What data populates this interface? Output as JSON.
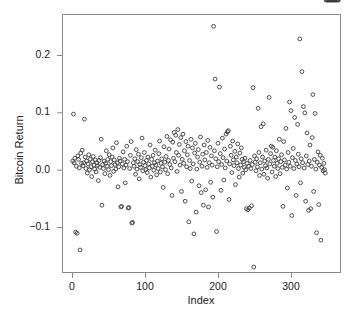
{
  "figure": {
    "background": "#ffffff",
    "plot_box": {
      "left": 62,
      "top": 14,
      "right": 340,
      "bottom": 272
    },
    "frame_color": "#8a8a8a",
    "marker_color": "#3c3c3c",
    "marker_radius": 1.9,
    "marker_shape": "open-circle"
  },
  "axes": {
    "x_title": "Index",
    "y_title": "Bitcoin Return",
    "x_ticks": [
      {
        "value": 0,
        "label": "0",
        "px": 72
      },
      {
        "value": 100,
        "label": "100",
        "px": 145
      },
      {
        "value": 200,
        "label": "200",
        "px": 218
      },
      {
        "value": 300,
        "label": "300",
        "px": 291
      }
    ],
    "y_ticks": [
      {
        "value": 0.2,
        "label": "0.2",
        "px": 55
      },
      {
        "value": 0.1,
        "label": "0.1",
        "px": 112.3
      },
      {
        "value": 0.0,
        "label": "0.0",
        "px": 169.7
      },
      {
        "value": -0.1,
        "label": "-0.1",
        "px": 227
      }
    ]
  },
  "chart_data": {
    "type": "scatter",
    "title": "",
    "xlabel": "Index",
    "ylabel": "Bitcoin Return",
    "xlim": [
      -8,
      375
    ],
    "ylim": [
      -0.178,
      0.262
    ],
    "grid": false,
    "legend": null,
    "n_points": 365,
    "marker": "open circle",
    "x": [
      1,
      2,
      3,
      4,
      5,
      6,
      7,
      8,
      9,
      10,
      11,
      12,
      13,
      14,
      15,
      16,
      17,
      18,
      19,
      20,
      21,
      22,
      23,
      24,
      25,
      26,
      27,
      28,
      29,
      30,
      31,
      32,
      33,
      34,
      35,
      36,
      37,
      38,
      39,
      40,
      41,
      42,
      43,
      44,
      45,
      46,
      47,
      48,
      49,
      50,
      51,
      52,
      53,
      54,
      55,
      56,
      57,
      58,
      59,
      60,
      61,
      62,
      63,
      64,
      65,
      66,
      67,
      68,
      69,
      70,
      71,
      72,
      73,
      74,
      75,
      76,
      77,
      78,
      79,
      80,
      81,
      82,
      83,
      84,
      85,
      86,
      87,
      88,
      89,
      90,
      91,
      92,
      93,
      94,
      95,
      96,
      97,
      98,
      99,
      100,
      101,
      102,
      103,
      104,
      105,
      106,
      107,
      108,
      109,
      110,
      111,
      112,
      113,
      114,
      115,
      116,
      117,
      118,
      119,
      120,
      121,
      122,
      123,
      124,
      125,
      126,
      127,
      128,
      129,
      130,
      131,
      132,
      133,
      134,
      135,
      136,
      137,
      138,
      139,
      140,
      141,
      142,
      143,
      144,
      145,
      146,
      147,
      148,
      149,
      150,
      151,
      152,
      153,
      154,
      155,
      156,
      157,
      158,
      159,
      160,
      161,
      162,
      163,
      164,
      165,
      166,
      167,
      168,
      169,
      170,
      171,
      172,
      173,
      174,
      175,
      176,
      177,
      178,
      179,
      180,
      181,
      182,
      183,
      184,
      185,
      186,
      187,
      188,
      189,
      190,
      191,
      192,
      193,
      194,
      195,
      196,
      197,
      198,
      199,
      200,
      201,
      202,
      203,
      204,
      205,
      206,
      207,
      208,
      209,
      210,
      211,
      212,
      213,
      214,
      215,
      216,
      217,
      218,
      219,
      220,
      221,
      222,
      223,
      224,
      225,
      226,
      227,
      228,
      229,
      230,
      231,
      232,
      233,
      234,
      235,
      236,
      237,
      238,
      239,
      240,
      241,
      242,
      243,
      244,
      245,
      246,
      247,
      248,
      249,
      250,
      251,
      252,
      253,
      254,
      255,
      256,
      257,
      258,
      259,
      260,
      261,
      262,
      263,
      264,
      265,
      266,
      267,
      268,
      269,
      270,
      271,
      272,
      273,
      274,
      275,
      276,
      277,
      278,
      279,
      280,
      281,
      282,
      283,
      284,
      285,
      286,
      287,
      288,
      289,
      290,
      291,
      292,
      293,
      294,
      295,
      296,
      297,
      298,
      299,
      300,
      301,
      302,
      303,
      304,
      305,
      306,
      307,
      308,
      309,
      310,
      311,
      312,
      313,
      314,
      315,
      316,
      317,
      318,
      319,
      320,
      321,
      322,
      323,
      324,
      325,
      326,
      327,
      328,
      329,
      330,
      331,
      332,
      333,
      334,
      335,
      336,
      337,
      338,
      339,
      340,
      341,
      342,
      343,
      344,
      345,
      346,
      347,
      348,
      349,
      350,
      351,
      352,
      353,
      354,
      355,
      356,
      357,
      358,
      359,
      360,
      361,
      362,
      363,
      364,
      365
    ],
    "y": [
      0.015,
      0.097,
      0.012,
      0.02,
      -0.109,
      0.006,
      -0.111,
      0.024,
      0.018,
      0.003,
      -0.14,
      0.029,
      0.011,
      0.034,
      0.007,
      0.012,
      0.088,
      0.022,
      0.002,
      0.015,
      -0.006,
      0.01,
      0.026,
      0.0,
      0.018,
      0.005,
      -0.012,
      0.014,
      0.023,
      0.008,
      0.001,
      0.017,
      -0.004,
      0.012,
      0.007,
      -0.019,
      0.016,
      0.004,
      0.021,
      0.053,
      -0.062,
      0.009,
      0.002,
      0.015,
      -0.007,
      0.011,
      0.033,
      0.006,
      0.018,
      0.0,
      0.026,
      -0.01,
      0.014,
      0.007,
      0.022,
      0.038,
      -0.003,
      0.017,
      0.009,
      0.001,
      0.047,
      0.012,
      -0.03,
      0.005,
      0.02,
      0.015,
      -0.065,
      -0.064,
      0.01,
      0.031,
      0.003,
      0.018,
      -0.023,
      0.008,
      0.041,
      0.014,
      -0.067,
      -0.066,
      0.002,
      0.025,
      0.049,
      -0.093,
      -0.092,
      0.012,
      0.006,
      0.019,
      -0.008,
      0.035,
      0.001,
      0.014,
      0.027,
      -0.016,
      0.009,
      0.004,
      0.021,
      0.055,
      -0.002,
      0.013,
      0.03,
      0.007,
      0.0,
      0.016,
      -0.005,
      0.022,
      0.01,
      0.003,
      0.043,
      -0.013,
      0.018,
      0.006,
      0.025,
      -0.001,
      0.012,
      0.034,
      0.008,
      -0.009,
      0.015,
      0.002,
      0.028,
      0.05,
      -0.004,
      0.011,
      0.019,
      0.005,
      -0.031,
      0.04,
      0.013,
      0.0,
      0.023,
      0.058,
      -0.007,
      0.016,
      0.036,
      0.009,
      0.052,
      0.003,
      -0.045,
      0.048,
      0.02,
      0.065,
      0.014,
      0.06,
      0.03,
      -0.003,
      0.07,
      0.025,
      0.044,
      0.008,
      0.056,
      -0.038,
      0.018,
      0.062,
      0.011,
      0.033,
      -0.055,
      0.049,
      0.005,
      0.026,
      0.041,
      -0.091,
      0.016,
      0.002,
      0.053,
      -0.02,
      0.038,
      0.01,
      -0.112,
      0.029,
      0.046,
      -0.074,
      0.001,
      0.022,
      0.035,
      -0.028,
      0.013,
      0.057,
      -0.04,
      0.006,
      0.027,
      -0.062,
      0.043,
      0.017,
      -0.035,
      0.03,
      0.004,
      0.051,
      -0.065,
      0.012,
      0.039,
      -0.022,
      0.024,
      0.008,
      -0.048,
      0.25,
      0.033,
      0.158,
      0.019,
      -0.108,
      0.005,
      0.046,
      0.014,
      0.144,
      0.028,
      -0.036,
      0.009,
      0.055,
      0.021,
      -0.018,
      0.036,
      0.003,
      0.062,
      0.015,
      0.066,
      0.068,
      -0.052,
      0.01,
      0.041,
      0.025,
      -0.005,
      0.05,
      0.017,
      0.007,
      0.032,
      -0.026,
      0.022,
      0.012,
      0.045,
      0.002,
      -0.013,
      0.029,
      0.008,
      0.038,
      0.018,
      -0.006,
      0.014,
      0.004,
      0.02,
      0.0,
      -0.068,
      0.011,
      -0.07,
      0.006,
      -0.067,
      0.016,
      0.002,
      -0.063,
      0.009,
      0.143,
      -0.17,
      0.024,
      0.013,
      -0.002,
      0.019,
      0.005,
      0.107,
      0.03,
      -0.01,
      0.012,
      0.075,
      0.001,
      0.022,
      0.08,
      -0.008,
      0.015,
      0.007,
      0.034,
      0.003,
      -0.015,
      0.018,
      0.126,
      0.01,
      0.028,
      0.041,
      -0.004,
      0.039,
      0.016,
      0.006,
      0.022,
      -0.012,
      0.033,
      0.011,
      0.002,
      0.019,
      0.053,
      -0.007,
      0.014,
      0.026,
      0.004,
      -0.064,
      0.049,
      0.017,
      0.008,
      0.072,
      0.001,
      -0.032,
      0.03,
      0.013,
      0.118,
      0.006,
      0.103,
      -0.08,
      0.021,
      0.037,
      0.002,
      0.091,
      0.016,
      -0.045,
      0.01,
      0.079,
      0.027,
      0.005,
      0.228,
      -0.023,
      0.019,
      0.171,
      0.012,
      0.11,
      0.003,
      0.099,
      -0.055,
      0.024,
      0.064,
      0.009,
      -0.071,
      0.015,
      0.043,
      -0.068,
      0.006,
      0.056,
      0.131,
      -0.038,
      0.018,
      0.098,
      0.001,
      -0.11,
      0.013,
      0.031,
      -0.061,
      0.008,
      0.025,
      -0.123,
      0.004,
      0.02,
      -0.002,
      0.011,
      0.0,
      -0.006
    ]
  }
}
